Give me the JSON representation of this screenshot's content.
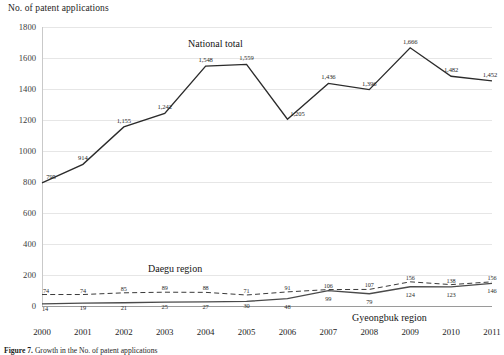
{
  "axis": {
    "y_title": "No. of patent applications",
    "y_ticks": [
      "1800",
      "1600",
      "1400",
      "1200",
      "1000",
      "800",
      "600",
      "400",
      "200",
      "0"
    ],
    "x_ticks": [
      "2000",
      "2001",
      "2002",
      "2003",
      "2004",
      "2005",
      "2006",
      "2007",
      "2008",
      "2009",
      "2010",
      "2011"
    ]
  },
  "annotations": {
    "national_total": "National total",
    "daegu_region": "Daegu region",
    "gyeongbuk_region": "Gyeongbuk region"
  },
  "caption": {
    "label": "Figure 7.",
    "text": "Growth in the No. of patent applications"
  },
  "chart_data": {
    "type": "line",
    "title": "",
    "xlabel": "",
    "ylabel": "No. of patent applications",
    "ylim": [
      0,
      1800
    ],
    "ytick_step": 200,
    "grid": true,
    "legend_position": "inline-annotations",
    "categories": [
      "2000",
      "2001",
      "2002",
      "2003",
      "2004",
      "2005",
      "2006",
      "2007",
      "2008",
      "2009",
      "2010",
      "2011"
    ],
    "series": [
      {
        "name": "National total",
        "style": "solid",
        "color": "#2b2b2b",
        "values": [
          795,
          914,
          1155,
          1242,
          1548,
          1559,
          1205,
          1436,
          1396,
          1666,
          1482,
          1452
        ],
        "labels": [
          "795",
          "914",
          "1,155",
          "1,242",
          "1,548",
          "1,559",
          "1,205",
          "1,436",
          "1,396",
          "1,666",
          "1,482",
          "1,452"
        ]
      },
      {
        "name": "Daegu region",
        "style": "dashed",
        "color": "#3a3a3a",
        "values": [
          74,
          74,
          85,
          89,
          88,
          71,
          91,
          106,
          107,
          156,
          138,
          156
        ],
        "labels": [
          "74",
          "74",
          "85",
          "89",
          "88",
          "71",
          "91",
          "106",
          "107",
          "156",
          "138",
          "156"
        ]
      },
      {
        "name": "Gyeongbuk region",
        "style": "solid",
        "color": "#4a4a4a",
        "values": [
          14,
          19,
          21,
          25,
          27,
          30,
          48,
          99,
          79,
          124,
          123,
          146
        ],
        "labels": [
          "14",
          "19",
          "21",
          "25",
          "27",
          "30",
          "48",
          "99",
          "79",
          "124",
          "123",
          "146"
        ]
      }
    ]
  }
}
